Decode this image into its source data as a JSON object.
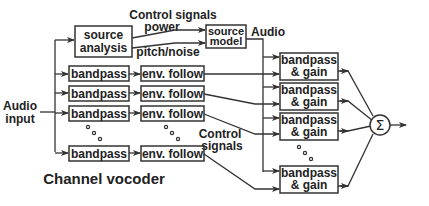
{
  "diagram": {
    "title": "Channel vocoder",
    "input_label_line1": "Audio",
    "input_label_line2": "input",
    "source_analysis": {
      "line1": "source",
      "line2": "analysis"
    },
    "source_model": {
      "line1": "source",
      "line2": "model"
    },
    "control_signals_top": "Control signals",
    "power_label": "power",
    "pitch_noise_label": "pitch/noise",
    "audio_label": "Audio",
    "control_signals_mid_line1": "Control",
    "control_signals_mid_line2": "signals",
    "analysis_bands": [
      {
        "bandpass": "bandpass",
        "env": "env. follow"
      },
      {
        "bandpass": "bandpass",
        "env": "env. follow"
      },
      {
        "bandpass": "bandpass",
        "env": "env. follow"
      },
      {
        "bandpass": "bandpass",
        "env": "env. follow"
      }
    ],
    "synthesis_bands": [
      {
        "line1": "bandpass",
        "line2": "& gain"
      },
      {
        "line1": "bandpass",
        "line2": "& gain"
      },
      {
        "line1": "bandpass",
        "line2": "& gain"
      },
      {
        "line1": "bandpass",
        "line2": "& gain"
      }
    ],
    "sum_symbol": "Σ"
  }
}
